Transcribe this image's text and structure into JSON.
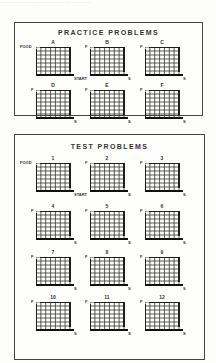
{
  "caption_top": "……………………………………",
  "practice": {
    "title": "PRACTICE PROBLEMS",
    "problems": [
      {
        "label": "A",
        "food_label": "FOOD",
        "start_label": "START"
      },
      {
        "label": "B",
        "food_label": "F",
        "start_label": "S"
      },
      {
        "label": "C",
        "food_label": "F",
        "start_label": "S"
      },
      {
        "label": "D",
        "food_label": "F",
        "start_label": "S"
      },
      {
        "label": "E",
        "food_label": "F",
        "start_label": "S"
      },
      {
        "label": "F",
        "food_label": "F",
        "start_label": "S"
      }
    ]
  },
  "test": {
    "title": "TEST PROBLEMS",
    "problems": [
      {
        "label": "1",
        "food_label": "FOOD",
        "start_label": "START"
      },
      {
        "label": "2",
        "food_label": "F",
        "start_label": "S"
      },
      {
        "label": "3",
        "food_label": "F",
        "start_label": "S"
      },
      {
        "label": "4",
        "food_label": "F",
        "start_label": "S"
      },
      {
        "label": "5",
        "food_label": "F",
        "start_label": "S"
      },
      {
        "label": "6",
        "food_label": "F",
        "start_label": "S"
      },
      {
        "label": "7",
        "food_label": "F",
        "start_label": "S"
      },
      {
        "label": "8",
        "food_label": "F",
        "start_label": "S"
      },
      {
        "label": "9",
        "food_label": "F",
        "start_label": "S"
      },
      {
        "label": "10",
        "food_label": "F",
        "start_label": "S"
      },
      {
        "label": "11",
        "food_label": "F",
        "start_label": "S"
      },
      {
        "label": "12",
        "food_label": "F",
        "start_label": "S"
      }
    ]
  }
}
